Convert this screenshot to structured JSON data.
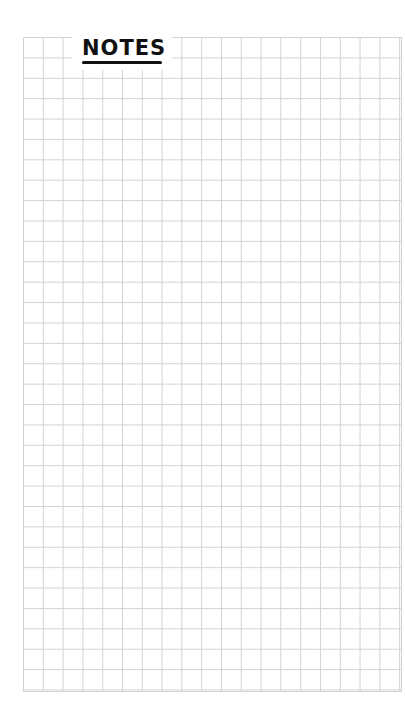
{
  "page": {
    "title": "NOTES",
    "paper": "grid",
    "colors": {
      "background": "#ffffff",
      "grid_line": "#d2d2d2",
      "title_ink": "#111111"
    }
  }
}
